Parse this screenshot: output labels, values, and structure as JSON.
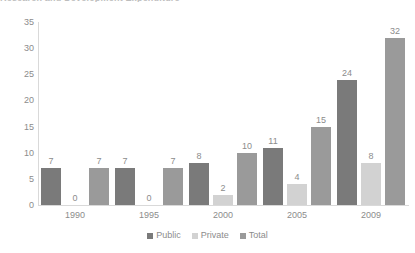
{
  "chart_data": {
    "type": "bar",
    "title": "",
    "xlabel": "",
    "ylabel": "",
    "ylim": [
      0,
      35
    ],
    "yticks": [
      0,
      5,
      10,
      15,
      20,
      25,
      30,
      35
    ],
    "grid": false,
    "legend_position": "bottom-center",
    "categories": [
      "1990",
      "1995",
      "2000",
      "2005",
      "2009"
    ],
    "series": [
      {
        "name": "Public",
        "color": "#7a7a7a",
        "values": [
          7,
          7,
          8,
          11,
          24
        ]
      },
      {
        "name": "Private",
        "color": "#d2d2d2",
        "values": [
          0,
          0,
          2,
          4,
          8
        ]
      },
      {
        "name": "Total",
        "color": "#9a9a9a",
        "values": [
          7,
          7,
          10,
          15,
          32
        ]
      }
    ],
    "data_labels": [
      [
        "7",
        "0",
        "7"
      ],
      [
        "7",
        "0",
        "7"
      ],
      [
        "8",
        "2",
        "10"
      ],
      [
        "11",
        "4",
        "15"
      ],
      [
        "24",
        "8",
        "32"
      ]
    ]
  },
  "axis": {
    "y_tick_labels": [
      "35",
      "30",
      "25",
      "20",
      "15",
      "10",
      "5",
      "0"
    ],
    "x_tick_labels": [
      "1990",
      "1995",
      "2000",
      "2005",
      "2009"
    ]
  },
  "legend": {
    "items": [
      {
        "label": "Public"
      },
      {
        "label": "Private"
      },
      {
        "label": "Total"
      }
    ]
  },
  "title_sliver": {
    "text": "Research and Development Expenditure"
  }
}
